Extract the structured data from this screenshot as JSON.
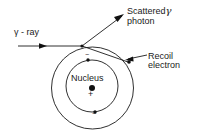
{
  "figure": {
    "background_color": "#ffffff",
    "stroke_color": "#1a1a1a",
    "labels": {
      "incident_ray": "γ - ray",
      "scattered_photon_line1": "Scattered",
      "scattered_photon_gamma": "γ",
      "scattered_photon_line2": "photon",
      "recoil_electron_line1": "Recoil",
      "recoil_electron_line2": "electron",
      "nucleus": "Nucleus",
      "nucleus_charge": "+",
      "electron_charge_top": "−",
      "electron_charge_bottom": "−"
    },
    "geometry": {
      "outer_shell": {
        "cx": 92.5,
        "cy": 88,
        "r": 41
      },
      "inner_shell": {
        "cx": 92,
        "cy": 86,
        "r": 26
      },
      "nucleus_dot": {
        "cx": 92,
        "cy": 88,
        "r": 3
      },
      "electron_top_dot": {
        "cx": 88,
        "cy": 60,
        "r": 1.7
      },
      "electron_bottom_dot": {
        "cx": 95,
        "cy": 112,
        "r": 1.7
      },
      "recoil_electron_dot": {
        "cx": 129,
        "cy": 62,
        "r": 1.7
      },
      "scatter_point": {
        "x": 82,
        "y": 46
      },
      "incident_ray": {
        "x1": 18,
        "y1": 46,
        "x2": 82,
        "y2": 46
      },
      "incident_arrow_at": {
        "x": 45,
        "y": 46
      },
      "scattered_photon_ray": {
        "x1": 82,
        "y1": 46,
        "x2": 124,
        "y2": 15
      },
      "recoil_electron_ray": {
        "x1": 82,
        "y1": 46,
        "x2": 129,
        "y2": 62
      },
      "recoil_pointer": {
        "x1": 146,
        "y1": 55,
        "x2": 127,
        "y2": 60
      }
    }
  }
}
